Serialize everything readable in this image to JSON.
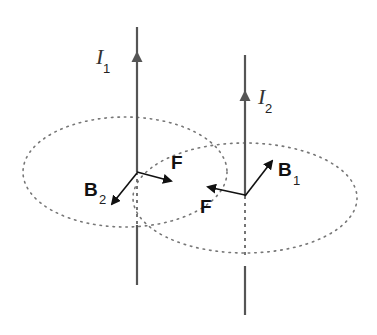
{
  "diagram": {
    "colors": {
      "wire": "#555555",
      "vector": "#111111",
      "field_line": "#777777",
      "background": "#ffffff"
    },
    "wires": [
      {
        "label": "I",
        "subscript": "1",
        "direction": "up"
      },
      {
        "label": "I",
        "subscript": "2",
        "direction": "up"
      }
    ],
    "field_loops": [
      {
        "around": "wire-1",
        "style": "dotted-ellipse"
      },
      {
        "around": "wire-2",
        "style": "dotted-ellipse"
      }
    ],
    "vectors": [
      {
        "label": "B",
        "subscript": "2",
        "at": "wire-1",
        "meaning": "magnetic field of wire 2 at wire 1"
      },
      {
        "label": "F",
        "subscript": "",
        "at": "wire-1",
        "meaning": "force on wire 1 toward wire 2"
      },
      {
        "label": "B",
        "subscript": "1",
        "at": "wire-2",
        "meaning": "magnetic field of wire 1 at wire 2"
      },
      {
        "label": "F",
        "subscript": "",
        "at": "wire-2",
        "meaning": "force on wire 2 toward wire 1"
      }
    ]
  }
}
